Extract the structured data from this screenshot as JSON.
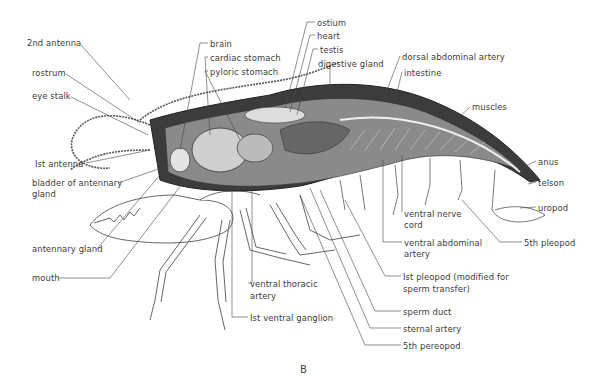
{
  "diagram": {
    "figure_label": "B",
    "labels": [
      {
        "text": "2nd antenna",
        "x": 27,
        "y": 38
      },
      {
        "text": "rostrum",
        "x": 32,
        "y": 68
      },
      {
        "text": "eye stalk",
        "x": 32,
        "y": 91
      },
      {
        "text": "Ist  antenna",
        "x": 35,
        "y": 159
      },
      {
        "text": "bladder of antennary",
        "x": 32,
        "y": 178
      },
      {
        "text": "gland",
        "x": 32,
        "y": 189
      },
      {
        "text": "antennary gland",
        "x": 32,
        "y": 244
      },
      {
        "text": "mouth",
        "x": 32,
        "y": 273
      },
      {
        "text": "brain",
        "x": 210,
        "y": 39
      },
      {
        "text": "cardiac stomach",
        "x": 210,
        "y": 53
      },
      {
        "text": "pyloric stomach",
        "x": 210,
        "y": 67
      },
      {
        "text": "ostium",
        "x": 317,
        "y": 18
      },
      {
        "text": "heart",
        "x": 317,
        "y": 31
      },
      {
        "text": "testis",
        "x": 320,
        "y": 45
      },
      {
        "text": "digestive gland",
        "x": 318,
        "y": 59
      },
      {
        "text": "dorsal abdominal artery",
        "x": 402,
        "y": 52
      },
      {
        "text": "intestine",
        "x": 404,
        "y": 68
      },
      {
        "text": "muscles",
        "x": 472,
        "y": 102
      },
      {
        "text": "anus",
        "x": 538,
        "y": 157
      },
      {
        "text": "telson",
        "x": 538,
        "y": 178
      },
      {
        "text": "uropod",
        "x": 538,
        "y": 203
      },
      {
        "text": "5th pleopod",
        "x": 524,
        "y": 238
      },
      {
        "text": "ventral nerve",
        "x": 404,
        "y": 209
      },
      {
        "text": "cord",
        "x": 404,
        "y": 220
      },
      {
        "text": "ventral abdominal",
        "x": 404,
        "y": 238
      },
      {
        "text": "artery",
        "x": 404,
        "y": 249
      },
      {
        "text": "Ist pleopod (modified for",
        "x": 403,
        "y": 272
      },
      {
        "text": "sperm transfer)",
        "x": 403,
        "y": 284
      },
      {
        "text": "sperm duct",
        "x": 403,
        "y": 307
      },
      {
        "text": "sternal artery",
        "x": 403,
        "y": 324
      },
      {
        "text": "5th pereopod",
        "x": 403,
        "y": 341
      },
      {
        "text": "ventral thoracic",
        "x": 250,
        "y": 279
      },
      {
        "text": "artery",
        "x": 250,
        "y": 291
      },
      {
        "text": "Ist ventral ganglion",
        "x": 250,
        "y": 313
      }
    ]
  }
}
